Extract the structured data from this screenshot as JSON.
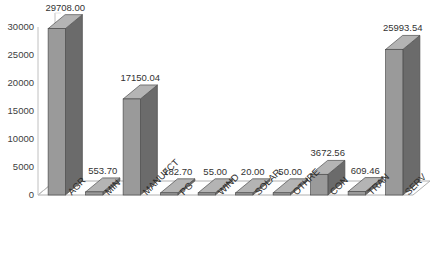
{
  "chart_data": {
    "type": "bar",
    "title": "",
    "subtitle": "",
    "xlabel": "",
    "ylabel": "",
    "categories": [
      "AGR",
      "MIN",
      "MANUFCT",
      "PG",
      "WIND",
      "SOLAR",
      "OTHRE",
      "CON",
      "TRAN",
      "SERV"
    ],
    "values": [
      29708.0,
      553.7,
      17150.04,
      182.7,
      55.0,
      20.0,
      50.0,
      3672.56,
      609.46,
      25993.54
    ],
    "value_labels": [
      "29708.00",
      "553.70",
      "17150.04",
      "182.70",
      "55.00",
      "20.00",
      "50.00",
      "3672.56",
      "609.46",
      "25993.54"
    ],
    "ylim": [
      0,
      30000
    ],
    "ytick_labels": [
      "0",
      "5000",
      "10000",
      "15000",
      "20000",
      "25000",
      "30000"
    ],
    "ytick_values": [
      0,
      5000,
      10000,
      15000,
      20000,
      25000,
      30000
    ],
    "grid": false,
    "legend": false,
    "legend_position": "none",
    "style": "3d-column",
    "colors": {
      "bar_front": "#9a9a9a",
      "bar_side": "#6b6b6b",
      "bar_top": "#b4b4b4",
      "bar_outline": "#4d4d4d",
      "floor": "#fefefe",
      "floor_outline": "#b0b0b0",
      "axis_line": "#c0c0c0",
      "text": "#333333"
    }
  },
  "axis": {
    "y_ticks": [
      "30000",
      "25000",
      "20000",
      "15000",
      "10000",
      "5000",
      "0"
    ]
  },
  "clipped": {
    "top_text": ""
  }
}
